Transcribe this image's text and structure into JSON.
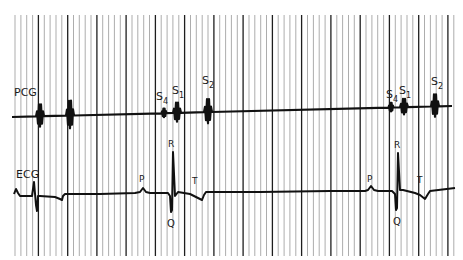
{
  "chart_data": {
    "type": "line",
    "title": "",
    "xlabel": "",
    "ylabel": "",
    "grid": {
      "orientation": "vertical",
      "x_start": 15,
      "x_end": 455,
      "y_start": 15,
      "y_end": 256,
      "minor_spacing_px": 5.85,
      "major_every": 5,
      "color_minor": "#8a8a8a",
      "color_major": "#1e1e1e"
    },
    "series": [
      {
        "name": "PCG",
        "label": "PCG",
        "kind": "phonocardiogram",
        "baseline_y_start": 117,
        "baseline_y_end": 106,
        "x_range": [
          12,
          452
        ],
        "events": [
          {
            "label": "",
            "x": 40,
            "amplitude": 13,
            "type": "burst"
          },
          {
            "label": "",
            "x": 70,
            "amplitude": 16,
            "type": "burst"
          },
          {
            "label": "S4",
            "x": 164,
            "amplitude": 5,
            "type": "burst"
          },
          {
            "label": "S1",
            "x": 177,
            "amplitude": 11,
            "type": "burst"
          },
          {
            "label": "S2",
            "x": 208,
            "amplitude": 14,
            "type": "burst"
          },
          {
            "label": "S4",
            "x": 391,
            "amplitude": 5,
            "type": "burst"
          },
          {
            "label": "S1",
            "x": 404,
            "amplitude": 9,
            "type": "burst"
          },
          {
            "label": "S2",
            "x": 435,
            "amplitude": 13,
            "type": "burst"
          }
        ]
      },
      {
        "name": "ECG",
        "label": "ECG",
        "kind": "electrocardiogram",
        "baseline_y": 193,
        "x_range": [
          14,
          455
        ],
        "waves": [
          {
            "label": "P",
            "x": 143
          },
          {
            "label": "R",
            "x": 173,
            "peak_y": 152
          },
          {
            "label": "Q",
            "x": 173,
            "trough_y": 212
          },
          {
            "label": "T",
            "x": 195
          },
          {
            "label": "P",
            "x": 371
          },
          {
            "label": "R",
            "x": 398,
            "peak_y": 153
          },
          {
            "label": "Q",
            "x": 398,
            "trough_y": 210
          },
          {
            "label": "T",
            "x": 420
          }
        ]
      }
    ],
    "annotations": [
      "PCG",
      "ECG",
      "S4",
      "S1",
      "S2",
      "P",
      "R",
      "Q",
      "T"
    ]
  },
  "labels": {
    "pcg": "PCG",
    "ecg": "ECG",
    "s4_a": "S",
    "s4_a_sub": "4",
    "s1_a": "S",
    "s1_a_sub": "1",
    "s2_a": "S",
    "s2_a_sub": "2",
    "s4_b": "S",
    "s4_b_sub": "4",
    "s1_b": "S",
    "s1_b_sub": "1",
    "s2_b": "S",
    "s2_b_sub": "2",
    "p_a": "P",
    "r_a": "R",
    "q_a": "Q",
    "t_a": "T",
    "p_b": "P",
    "r_b": "R",
    "q_b": "Q",
    "t_b": "T"
  }
}
